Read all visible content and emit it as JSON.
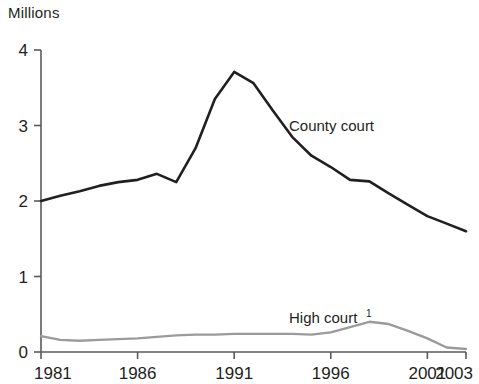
{
  "chart_data": {
    "type": "line",
    "title": "",
    "subtitle": "",
    "unit_label": "Millions",
    "xlabel": "",
    "ylabel": "",
    "xlim": [
      1981,
      2003
    ],
    "ylim": [
      0,
      4
    ],
    "grid": false,
    "legend_position": "inline-annotation",
    "x_tick_labels": [
      "1981",
      "1986",
      "1991",
      "1996",
      "2001",
      "2003"
    ],
    "x_tick_values": [
      1981,
      1986,
      1991,
      1996,
      2001,
      2003
    ],
    "y_tick_labels": [
      "0",
      "1",
      "2",
      "3",
      "4"
    ],
    "y_tick_values": [
      0,
      1,
      2,
      3,
      4
    ],
    "x": [
      1981,
      1982,
      1983,
      1984,
      1985,
      1986,
      1987,
      1988,
      1989,
      1990,
      1991,
      1992,
      1993,
      1994,
      1995,
      1996,
      1997,
      1998,
      1999,
      2000,
      2001,
      2002,
      2003
    ],
    "series": [
      {
        "name": "County court",
        "label": "County court",
        "color": "#231f20",
        "values": [
          2.0,
          2.07,
          2.13,
          2.2,
          2.25,
          2.28,
          2.36,
          2.25,
          2.7,
          3.35,
          3.71,
          3.56,
          3.2,
          2.85,
          2.6,
          2.45,
          2.28,
          2.26,
          2.1,
          1.95,
          1.8,
          1.7,
          1.6
        ]
      },
      {
        "name": "High court",
        "label": "High court",
        "label_superscript": "1",
        "color": "#9b9b9b",
        "values": [
          0.21,
          0.16,
          0.15,
          0.16,
          0.17,
          0.18,
          0.2,
          0.22,
          0.23,
          0.23,
          0.24,
          0.24,
          0.24,
          0.24,
          0.23,
          0.26,
          0.33,
          0.4,
          0.37,
          0.28,
          0.18,
          0.06,
          0.04
        ]
      }
    ],
    "annotations": [
      {
        "text": "County court",
        "x": 1997,
        "y": 2.95
      },
      {
        "text": "High court",
        "x": 1995,
        "y": 0.62
      }
    ]
  }
}
